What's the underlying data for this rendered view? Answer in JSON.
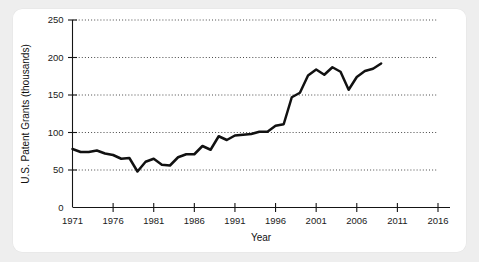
{
  "chart_data": {
    "type": "line",
    "title": "",
    "xlabel": "Year",
    "ylabel": "U.S. Patent Grants (thousands)",
    "xlim": [
      1971,
      2016
    ],
    "ylim": [
      0,
      250
    ],
    "xticks": [
      1971,
      1976,
      1981,
      1986,
      1991,
      1996,
      2001,
      2006,
      2011,
      2016
    ],
    "xtick_labels": [
      "1971",
      "1976",
      "1981",
      "1986",
      "1991",
      "1996",
      "2001",
      "2006",
      "2011",
      "2016"
    ],
    "yticks": [
      0,
      50,
      100,
      150,
      200,
      250
    ],
    "ytick_labels": [
      "0",
      "50",
      "100",
      "150",
      "200",
      "250"
    ],
    "grid": true,
    "grid_axis": "y",
    "legend": false,
    "line_color": "#111111",
    "series": [
      {
        "name": "U.S. Patent Grants",
        "x": [
          1971,
          1972,
          1973,
          1974,
          1975,
          1976,
          1977,
          1978,
          1979,
          1980,
          1981,
          1982,
          1983,
          1984,
          1985,
          1986,
          1987,
          1988,
          1989,
          1990,
          1991,
          1992,
          1993,
          1994,
          1995,
          1996,
          1997,
          1998,
          1999,
          2000,
          2001,
          2002,
          2003,
          2004,
          2005,
          2006,
          2007,
          2008,
          2009
        ],
        "values": [
          78,
          74,
          74,
          76,
          72,
          70,
          65,
          66,
          48,
          61,
          65,
          57,
          56,
          67,
          71,
          71,
          82,
          77,
          95,
          90,
          96,
          97,
          98,
          101,
          101,
          109,
          111,
          147,
          153,
          176,
          184,
          177,
          187,
          181,
          157,
          174,
          182,
          185,
          192
        ]
      }
    ]
  },
  "axis": {
    "x_title": "Year",
    "y_title": "U.S. Patent Grants (thousands)"
  }
}
